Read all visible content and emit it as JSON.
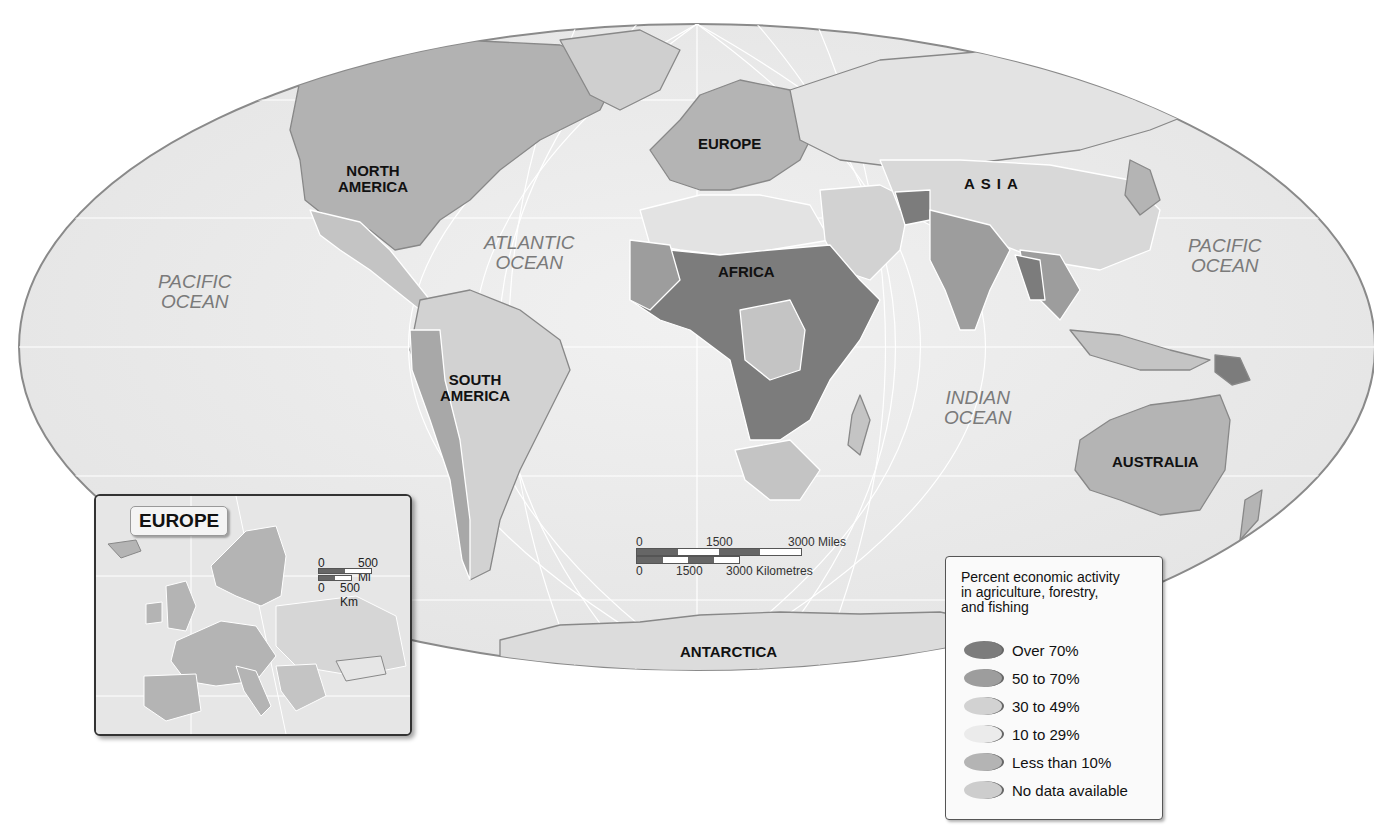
{
  "map": {
    "projection": "Robinson-style oval world map",
    "continent_labels": {
      "north_america": "NORTH\nAMERICA",
      "south_america": "SOUTH\nAMERICA",
      "europe": "EUROPE",
      "africa": "AFRICA",
      "asia": "ASIA",
      "australia": "AUSTRALIA",
      "antarctica": "ANTARCTICA"
    },
    "ocean_labels": {
      "pacific_west": "PACIFIC\nOCEAN",
      "pacific_east": "PACIFIC\nOCEAN",
      "atlantic": "ATLANTIC\nOCEAN",
      "indian": "INDIAN\nOCEAN"
    },
    "colors": {
      "ocean": "#ececec",
      "over_70": "#7c7c7c",
      "50_to_70": "#9d9d9d",
      "30_to_49": "#c4c4c4",
      "10_to_29": "#e3e3e3",
      "less_than_10": "#b2b2b2",
      "no_data": "#cfcfcf"
    }
  },
  "scale_bar": {
    "miles": {
      "ticks": [
        "0",
        "1500",
        "3000 Miles"
      ]
    },
    "kilometres": {
      "ticks": [
        "0",
        "1500",
        "3000 Kilometres"
      ]
    }
  },
  "inset": {
    "title": "EUROPE",
    "scale": {
      "miles": {
        "ticks": [
          "0",
          "500 Mi"
        ]
      },
      "kilometres": {
        "ticks": [
          "0",
          "500 Km"
        ]
      }
    }
  },
  "legend": {
    "title": "Percent economic activity\nin agriculture, forestry,\nand fishing",
    "items": [
      {
        "label": "Over 70%",
        "color": "#7c7c7c"
      },
      {
        "label": "50 to 70%",
        "color": "#9d9d9d"
      },
      {
        "label": "30 to 49%",
        "color": "#d2d2d2"
      },
      {
        "label": "10 to 29%",
        "color": "#ebebeb"
      },
      {
        "label": "Less than 10%",
        "color": "#b4b4b4"
      },
      {
        "label": "No data available",
        "color": "#cdcdcd"
      }
    ]
  }
}
